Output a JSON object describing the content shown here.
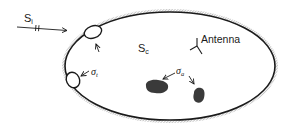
{
  "diagram": {
    "type": "cavity-schematic",
    "labels": {
      "incident_power": "S",
      "incident_power_sub": "i",
      "cavity_power": "S",
      "cavity_power_sub": "c",
      "transmission_cs": "σ",
      "transmission_cs_sub": "t",
      "absorption_cs": "σ",
      "absorption_cs_sub": "a",
      "antenna": "Antenna"
    },
    "elements": [
      {
        "id": "cavity",
        "shape": "ellipse",
        "edge": "hatched"
      },
      {
        "id": "aperture-top",
        "shape": "ellipse"
      },
      {
        "id": "aperture-left",
        "shape": "ellipse"
      },
      {
        "id": "absorber-1",
        "shape": "blob",
        "fill": "#3a3a3a"
      },
      {
        "id": "absorber-2",
        "shape": "blob",
        "fill": "#3a3a3a"
      },
      {
        "id": "antenna",
        "shape": "Y-symbol"
      }
    ],
    "colors": {
      "line": "#1a1a1a",
      "hatch": "#8a8a8a",
      "absorber": "#3a3a3a",
      "background": "#ffffff"
    }
  }
}
